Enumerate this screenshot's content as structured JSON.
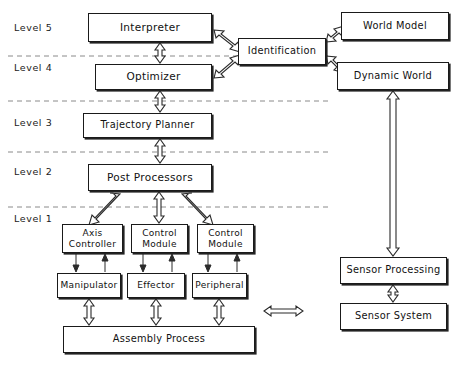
{
  "diagram": {
    "levels": [
      {
        "id": "level-5",
        "label": "Level  5",
        "x": 14,
        "y": 22,
        "divider_y": null
      },
      {
        "id": "level-4",
        "label": "Level  4",
        "x": 14,
        "y": 62,
        "divider_y": 56
      },
      {
        "id": "level-3",
        "label": "Level  3",
        "x": 14,
        "y": 117,
        "divider_y": 101
      },
      {
        "id": "level-2",
        "label": "Level  2",
        "x": 14,
        "y": 166,
        "divider_y": 152
      },
      {
        "id": "level-1",
        "label": "Level  1",
        "x": 14,
        "y": 213,
        "divider_y": 207
      }
    ],
    "boxes": [
      {
        "id": "interpreter",
        "label": "Interpreter",
        "x": 88,
        "y": 13,
        "w": 124,
        "h": 29,
        "font": "t11",
        "lines": [
          "Interpreter"
        ]
      },
      {
        "id": "optimizer",
        "label": "Optimizer",
        "x": 95,
        "y": 64,
        "w": 117,
        "h": 26,
        "font": "t11",
        "lines": [
          "Optimizer"
        ]
      },
      {
        "id": "trajectory-planner",
        "label": "Trajectory  Planner",
        "x": 83,
        "y": 113,
        "w": 129,
        "h": 25,
        "font": "t10",
        "lines": [
          "Trajectory  Planner"
        ]
      },
      {
        "id": "post-processors",
        "label": "Post  Processors",
        "x": 88,
        "y": 164,
        "w": 124,
        "h": 27,
        "font": "t11",
        "lines": [
          "Post  Processors"
        ]
      },
      {
        "id": "identification",
        "label": "Identification",
        "x": 238,
        "y": 38,
        "w": 88,
        "h": 27,
        "font": "t10",
        "lines": [
          "Identification"
        ]
      },
      {
        "id": "world-model",
        "label": "World  Model",
        "x": 341,
        "y": 12,
        "w": 108,
        "h": 28,
        "font": "t10",
        "lines": [
          "World  Model"
        ]
      },
      {
        "id": "dynamic-world",
        "label": "Dynamic  World",
        "x": 337,
        "y": 62,
        "w": 112,
        "h": 28,
        "font": "t10",
        "lines": [
          "Dynamic  World"
        ]
      },
      {
        "id": "axis-controller",
        "label": "Axis Controller",
        "x": 62,
        "y": 224,
        "w": 61,
        "h": 29,
        "font": "t9",
        "lines": [
          "Axis",
          "Controller"
        ]
      },
      {
        "id": "control-module-1",
        "label": "Control Module",
        "x": 131,
        "y": 224,
        "w": 57,
        "h": 29,
        "font": "t9",
        "lines": [
          "Control",
          "Module"
        ]
      },
      {
        "id": "control-module-2",
        "label": "Control Module",
        "x": 197,
        "y": 224,
        "w": 57,
        "h": 29,
        "font": "t9",
        "lines": [
          "Control",
          "Module"
        ]
      },
      {
        "id": "manipulator",
        "label": "Manipulator",
        "x": 57,
        "y": 273,
        "w": 64,
        "h": 25,
        "font": "t9",
        "lines": [
          "Manipulator"
        ]
      },
      {
        "id": "effector",
        "label": "Effector",
        "x": 127,
        "y": 273,
        "w": 58,
        "h": 25,
        "font": "t9",
        "lines": [
          "Effector"
        ]
      },
      {
        "id": "peripheral",
        "label": "Peripheral",
        "x": 192,
        "y": 273,
        "w": 55,
        "h": 25,
        "font": "t9",
        "lines": [
          "Peripheral"
        ]
      },
      {
        "id": "assembly-process",
        "label": "Assembly  Process",
        "x": 63,
        "y": 326,
        "w": 192,
        "h": 27,
        "font": "t10",
        "lines": [
          "Assembly  Process"
        ]
      },
      {
        "id": "sensor-processing",
        "label": "Sensor  Processing",
        "x": 340,
        "y": 257,
        "w": 107,
        "h": 27,
        "font": "t10",
        "lines": [
          "Sensor  Processing"
        ]
      },
      {
        "id": "sensor-system",
        "label": "Sensor  System",
        "x": 340,
        "y": 303,
        "w": 107,
        "h": 27,
        "font": "t10",
        "lines": [
          "Sensor  System"
        ]
      }
    ],
    "connectors": [
      {
        "id": "interpreter-optimizer",
        "from": "interpreter",
        "to": "optimizer",
        "kind": "double-arrow-vertical"
      },
      {
        "id": "optimizer-trajectory",
        "from": "optimizer",
        "to": "trajectory-planner",
        "kind": "double-arrow-vertical"
      },
      {
        "id": "trajectory-postprocessors",
        "from": "trajectory-planner",
        "to": "post-processors",
        "kind": "double-arrow-vertical"
      },
      {
        "id": "interpreter-identification",
        "from": "interpreter",
        "to": "identification",
        "kind": "double-arrow-diagonal"
      },
      {
        "id": "optimizer-identification",
        "from": "optimizer",
        "to": "identification",
        "kind": "double-arrow-diagonal"
      },
      {
        "id": "identification-world-model",
        "from": "identification",
        "to": "world-model",
        "kind": "double-arrow-diagonal"
      },
      {
        "id": "identification-dynamic-world",
        "from": "identification",
        "to": "dynamic-world",
        "kind": "double-arrow-diagonal"
      },
      {
        "id": "postprocessors-axis",
        "from": "post-processors",
        "to": "axis-controller",
        "kind": "double-arrow-diagonal"
      },
      {
        "id": "postprocessors-control-1",
        "from": "post-processors",
        "to": "control-module-1",
        "kind": "double-arrow-vertical"
      },
      {
        "id": "postprocessors-control-2",
        "from": "post-processors",
        "to": "control-module-2",
        "kind": "double-arrow-diagonal"
      },
      {
        "id": "axis-manipulator",
        "from": "axis-controller",
        "to": "manipulator",
        "kind": "line-pair"
      },
      {
        "id": "control1-effector",
        "from": "control-module-1",
        "to": "effector",
        "kind": "line-pair"
      },
      {
        "id": "control2-peripheral",
        "from": "control-module-2",
        "to": "peripheral",
        "kind": "line-pair"
      },
      {
        "id": "manipulator-assembly",
        "from": "manipulator",
        "to": "assembly-process",
        "kind": "double-arrow-vertical"
      },
      {
        "id": "effector-assembly",
        "from": "effector",
        "to": "assembly-process",
        "kind": "double-arrow-vertical"
      },
      {
        "id": "peripheral-assembly",
        "from": "peripheral",
        "to": "assembly-process",
        "kind": "double-arrow-vertical"
      },
      {
        "id": "assembly-sensor-system",
        "from": "assembly-process",
        "to": "sensor-system",
        "kind": "double-arrow-horizontal"
      },
      {
        "id": "sensor-system-processing",
        "from": "sensor-system",
        "to": "sensor-processing",
        "kind": "double-arrow-vertical"
      },
      {
        "id": "sensor-processing-dynamic",
        "from": "sensor-processing",
        "to": "dynamic-world",
        "kind": "double-arrow-vertical-long"
      }
    ]
  }
}
